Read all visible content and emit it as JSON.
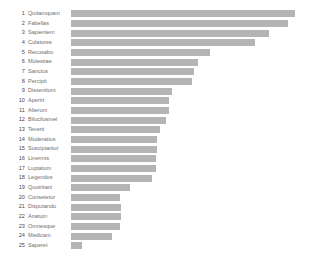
{
  "chart_data": {
    "type": "bar",
    "orientation": "horizontal",
    "title": "",
    "subtitle": "",
    "xlabel": "",
    "ylabel": "",
    "grid": false,
    "legend": false,
    "axis_visible": false,
    "bar_color": "#b4b4b4",
    "background_color": "#ffffff",
    "label_color": "#6e6e6e",
    "rank_color": "#4a4a4a",
    "xlim": [
      0,
      224
    ],
    "bar_origin_px": 74,
    "max_bar_end_px": 298,
    "categories": [
      "Quitamquam",
      "Fabellas",
      "Sapientem",
      "Culatores",
      "Recusabo",
      "Molestiae",
      "Sanctus",
      "Percipit",
      "Dissentiunt",
      "Aperirt",
      "Alterum",
      "Bilucilusmel",
      "Teverti",
      "Moderatius",
      "Suscipiantur",
      "Linermis",
      "Luptatum",
      "Legendos",
      "Quotritani",
      "Consetetur",
      "Disputando",
      "Anatum",
      "Omnesque",
      "Medicam",
      "Saperet"
    ],
    "ranks": [
      1,
      2,
      3,
      4,
      5,
      6,
      7,
      8,
      9,
      10,
      11,
      12,
      13,
      14,
      15,
      16,
      17,
      18,
      19,
      20,
      21,
      22,
      23,
      24,
      25
    ],
    "values": [
      224,
      217,
      198,
      184,
      139,
      127,
      123,
      121,
      101,
      98,
      98,
      95,
      89,
      86,
      86,
      85,
      85,
      81,
      59,
      49,
      50,
      50,
      49,
      41,
      11
    ],
    "rows": [
      {
        "rank": "1",
        "label": "Quitamquam",
        "value": 224
      },
      {
        "rank": "2",
        "label": "Fabellas",
        "value": 217
      },
      {
        "rank": "3",
        "label": "Sapientem",
        "value": 198
      },
      {
        "rank": "4",
        "label": "Culatores",
        "value": 184
      },
      {
        "rank": "5",
        "label": "Recusabo",
        "value": 139
      },
      {
        "rank": "6",
        "label": "Molestiae",
        "value": 127
      },
      {
        "rank": "7",
        "label": "Sanctus",
        "value": 123
      },
      {
        "rank": "8",
        "label": "Percipit",
        "value": 121
      },
      {
        "rank": "9",
        "label": "Dissentiunt",
        "value": 101
      },
      {
        "rank": "10",
        "label": "Aperirt",
        "value": 98
      },
      {
        "rank": "11",
        "label": "Alterum",
        "value": 98
      },
      {
        "rank": "12",
        "label": "Bilucilusmel",
        "value": 95
      },
      {
        "rank": "13",
        "label": "Teverti",
        "value": 89
      },
      {
        "rank": "14",
        "label": "Moderatius",
        "value": 86
      },
      {
        "rank": "15",
        "label": "Suscipiantur",
        "value": 86
      },
      {
        "rank": "16",
        "label": "Linermis",
        "value": 85
      },
      {
        "rank": "17",
        "label": "Luptatum",
        "value": 85
      },
      {
        "rank": "18",
        "label": "Legendos",
        "value": 81
      },
      {
        "rank": "19",
        "label": "Quotritani",
        "value": 59
      },
      {
        "rank": "20",
        "label": "Consetetur",
        "value": 49
      },
      {
        "rank": "21",
        "label": "Disputando",
        "value": 50
      },
      {
        "rank": "22",
        "label": "Anatum",
        "value": 50
      },
      {
        "rank": "23",
        "label": "Omnesque",
        "value": 49
      },
      {
        "rank": "24",
        "label": "Medicam",
        "value": 41
      },
      {
        "rank": "25",
        "label": "Saperet",
        "value": 11
      }
    ]
  }
}
